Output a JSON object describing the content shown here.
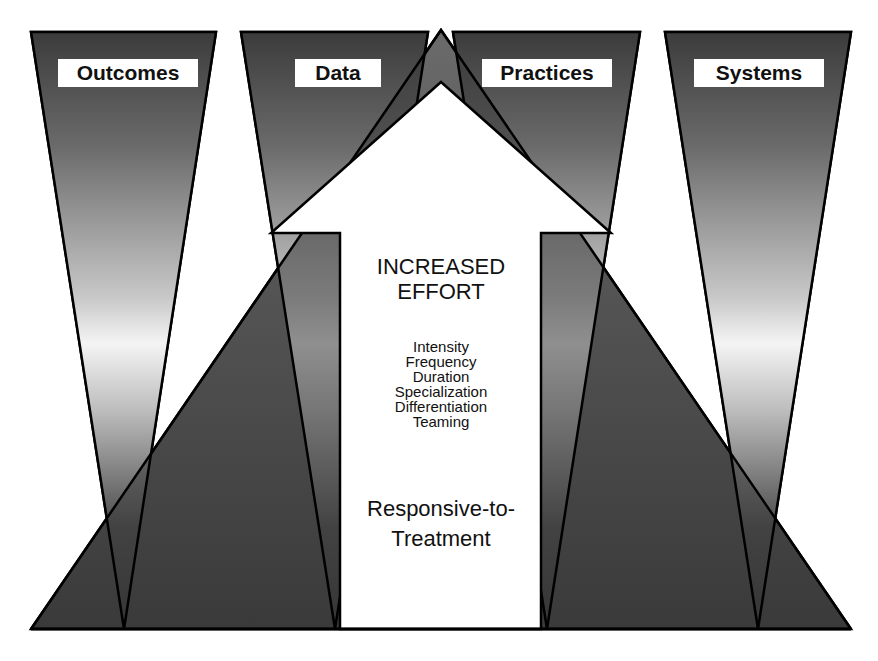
{
  "diagram": {
    "columns": [
      {
        "label": "Outcomes"
      },
      {
        "label": "Data"
      },
      {
        "label": "Practices"
      },
      {
        "label": "Systems"
      }
    ],
    "arrow": {
      "title_line1": "INCREASED",
      "title_line2": "EFFORT",
      "factors": [
        "Intensity",
        "Frequency",
        "Duration",
        "Specialization",
        "Differentiation",
        "Teaming"
      ],
      "footer_line1": "Responsive-to-",
      "footer_line2": "Treatment"
    },
    "colors": {
      "dark": "#3a3a3a",
      "light": "#f2f2f2",
      "outline": "#000000",
      "arrow_fill": "#ffffff"
    }
  }
}
